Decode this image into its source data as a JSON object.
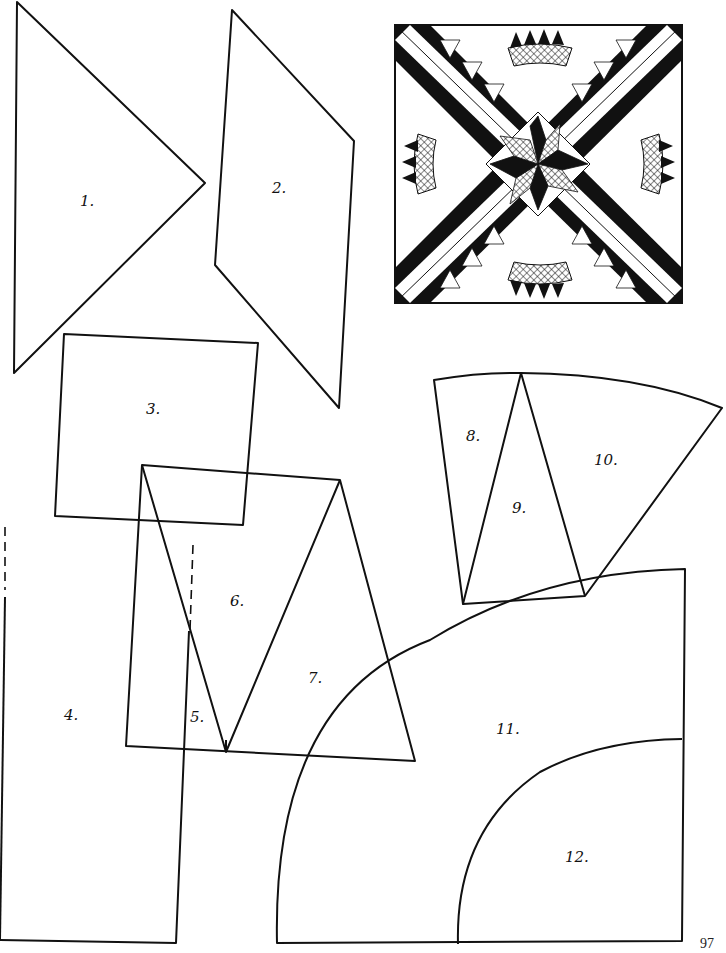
{
  "page": {
    "page_number": "97",
    "colors": {
      "ink": "#111111",
      "paper": "#ffffff"
    }
  },
  "block_illustration": {
    "name": "quilt-block-preview",
    "description": "Square quilt block: eight-pointed star center, diagonal white sashing forming an X, sawtooth triangle borders, four cross-hatched fan arcs with points"
  },
  "pieces": [
    {
      "id": "1",
      "label": "1.",
      "shape": "triangle"
    },
    {
      "id": "2",
      "label": "2.",
      "shape": "parallelogram"
    },
    {
      "id": "3",
      "label": "3.",
      "shape": "square"
    },
    {
      "id": "4",
      "label": "4.",
      "shape": "rectangle"
    },
    {
      "id": "5",
      "label": "5.",
      "shape": "narrow-strip"
    },
    {
      "id": "6",
      "label": "6.",
      "shape": "triangle"
    },
    {
      "id": "7",
      "label": "7.",
      "shape": "triangle"
    },
    {
      "id": "8",
      "label": "8.",
      "shape": "wedge-triangle"
    },
    {
      "id": "9",
      "label": "9.",
      "shape": "triangle"
    },
    {
      "id": "10",
      "label": "10.",
      "shape": "fan-wedge"
    },
    {
      "id": "11",
      "label": "11.",
      "shape": "arc-band"
    },
    {
      "id": "12",
      "label": "12.",
      "shape": "quarter-circle"
    }
  ]
}
